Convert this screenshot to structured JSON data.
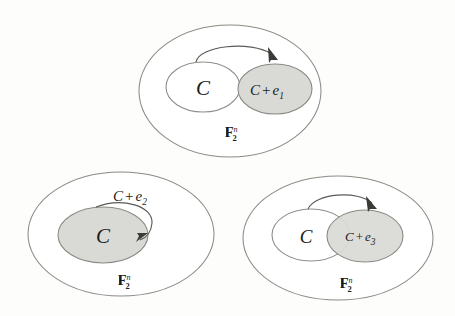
{
  "figure": {
    "name": "coset-shift-diagram",
    "background_color": "#fdfdfc",
    "shaded_color": "#d9d9d6",
    "line_color": "#8b8b86",
    "text_color": "#1c1c1a",
    "panels": [
      {
        "id": "panel-top",
        "position": "top-center",
        "ambient_space_label": "F",
        "ambient_space_sub": "2",
        "ambient_space_sup": "n",
        "code_label": "C",
        "coset_label_C": "C",
        "coset_label_plus": "+",
        "coset_label_e": "e",
        "coset_label_index": "1",
        "coset_full": "C + e1",
        "shaded_region": "coset",
        "arrow_kind": "arc-from-C-to-coset",
        "arrow_label": ""
      },
      {
        "id": "panel-bottom-left",
        "position": "bottom-left",
        "ambient_space_label": "F",
        "ambient_space_sub": "2",
        "ambient_space_sup": "n",
        "code_label": "C",
        "coset_label_C": "C",
        "coset_label_plus": "+",
        "coset_label_e": "e",
        "coset_label_index": "2",
        "coset_full": "C + e2",
        "shaded_region": "code",
        "arrow_kind": "self-loop-on-C",
        "arrow_label": "C + e2"
      },
      {
        "id": "panel-bottom-right",
        "position": "bottom-right",
        "ambient_space_label": "F",
        "ambient_space_sub": "2",
        "ambient_space_sup": "n",
        "code_label": "C",
        "coset_label_C": "C",
        "coset_label_plus": "+",
        "coset_label_e": "e",
        "coset_label_index": "3",
        "coset_full": "C + e3",
        "shaded_region": "coset-overlapping",
        "arrow_kind": "arc-from-C-to-coset",
        "arrow_label": ""
      }
    ]
  }
}
